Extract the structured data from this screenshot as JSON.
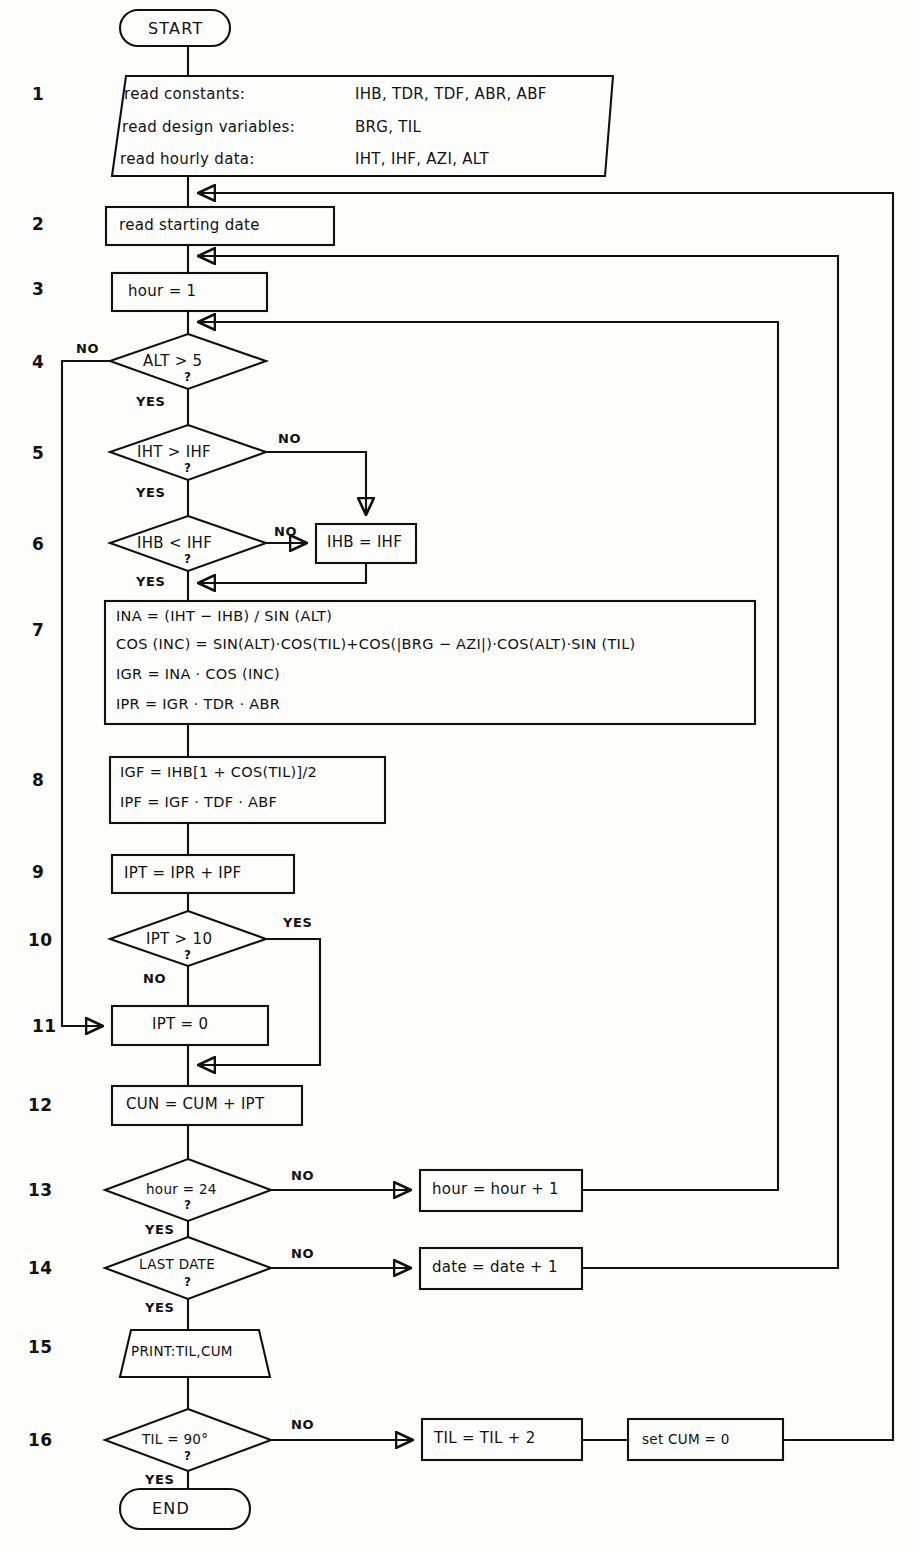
{
  "diagram": {
    "stroke_color": "#111111",
    "bg_color": "#fdfdfb"
  },
  "terminators": {
    "start": "START",
    "end": "END"
  },
  "step_numbers": [
    "1",
    "2",
    "3",
    "4",
    "5",
    "6",
    "7",
    "8",
    "9",
    "10",
    "11",
    "12",
    "13",
    "14",
    "15",
    "16"
  ],
  "steps": {
    "s1": {
      "num": "1",
      "shape": "parallelogram-io",
      "lines": [
        {
          "label": "read constants:",
          "vars": "IHB, TDR, TDF, ABR, ABF"
        },
        {
          "label": "read design variables:",
          "vars": "BRG, TIL"
        },
        {
          "label": "read  hourly data:",
          "vars": "IHT, IHF, AZI, ALT"
        }
      ]
    },
    "s2": {
      "num": "2",
      "shape": "process",
      "text": "read starting date"
    },
    "s3": {
      "num": "3",
      "shape": "process",
      "text": "hour = 1"
    },
    "s4": {
      "num": "4",
      "shape": "decision",
      "text": "ALT > 5",
      "q": "?",
      "yes": "YES",
      "no": "NO"
    },
    "s5": {
      "num": "5",
      "shape": "decision",
      "text": "IHT > IHF",
      "q": "?",
      "yes": "YES",
      "no": "NO"
    },
    "s6": {
      "num": "6",
      "shape": "decision",
      "text": "IHB < IHF",
      "q": "?",
      "yes": "YES",
      "no": "NO"
    },
    "s6b": {
      "shape": "process",
      "text": "IHB = IHF"
    },
    "s7": {
      "num": "7",
      "shape": "process",
      "formulas": [
        "INA = (IHT − IHB) / SIN (ALT)",
        "COS (INC) = SIN(ALT)·COS(TIL)+COS(|BRG − AZI|)·COS(ALT)·SIN (TIL)",
        "IGR = INA · COS (INC)",
        "IPR = IGR · TDR · ABR"
      ]
    },
    "s8": {
      "num": "8",
      "shape": "process",
      "formulas": [
        "IGF =  IHB[1 + COS(TIL)]/2",
        "IPF = IGF · TDF · ABF"
      ]
    },
    "s9": {
      "num": "9",
      "shape": "process",
      "text": "IPT  =  IPR + IPF"
    },
    "s10": {
      "num": "10",
      "shape": "decision",
      "text": "IPT > 10",
      "q": "?",
      "yes": "YES",
      "no": "NO"
    },
    "s11": {
      "num": "11",
      "shape": "process",
      "text": "IPT = 0"
    },
    "s12": {
      "num": "12",
      "shape": "process",
      "text": "CUN = CUM + IPT"
    },
    "s13": {
      "num": "13",
      "shape": "decision",
      "text": "hour = 24",
      "q": "?",
      "yes": "YES",
      "no": "NO"
    },
    "s13b": {
      "shape": "process",
      "text": "hour = hour + 1"
    },
    "s14": {
      "num": "14",
      "shape": "decision",
      "text": "LAST DATE",
      "q": "?",
      "yes": "YES",
      "no": "NO"
    },
    "s14b": {
      "shape": "process",
      "text": "date = date + 1"
    },
    "s15": {
      "num": "15",
      "shape": "parallelogram-io",
      "text": "PRINT:TIL,CUM"
    },
    "s16": {
      "num": "16",
      "shape": "decision",
      "text": "TIL = 90°",
      "q": "?",
      "yes": "YES",
      "no": "NO"
    },
    "s16b": {
      "shape": "process",
      "text": "TIL = TIL + 2"
    },
    "s16c": {
      "shape": "process",
      "text": "set  CUM = 0"
    }
  },
  "edge_labels": {
    "s4_no": "NO",
    "s4_yes": "YES",
    "s5_no": "NO",
    "s5_yes": "YES",
    "s6_no": "NO",
    "s6_yes": "YES",
    "s10_yes": "YES",
    "s10_no": "NO",
    "s13_no": "NO",
    "s13_yes": "YES",
    "s14_no": "NO",
    "s14_yes": "YES",
    "s16_no": "NO",
    "s16_yes": "YES"
  }
}
